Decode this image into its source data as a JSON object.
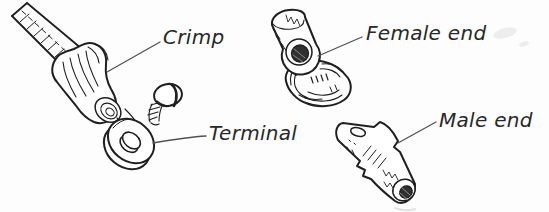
{
  "diagram": {
    "background": "#fdfdfd",
    "ink_color": "#1f1f1f",
    "leader_color": "#525252",
    "labels": {
      "crimp": "Crimp",
      "terminal": "Terminal",
      "female_end": "Female end",
      "male_end": "Male end"
    },
    "illustrations": [
      "wire-with-crimp-sleeve-and-ring-terminal",
      "screw",
      "female-end-connector",
      "male-end-connector"
    ]
  }
}
